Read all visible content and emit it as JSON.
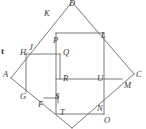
{
  "figure": {
    "type": "geometry-diagram",
    "stroke_color": "#6b6b6b",
    "label_color": "#3a3a3a",
    "background": "#ffffff",
    "width": 146,
    "height": 129
  },
  "labels": [
    {
      "id": "D",
      "text": "D",
      "x": 69,
      "y": -1
    },
    {
      "id": "K",
      "text": "K",
      "x": 44,
      "y": 9
    },
    {
      "id": "L",
      "text": "L",
      "x": 101,
      "y": 31
    },
    {
      "id": "P",
      "text": "P",
      "x": 53,
      "y": 36
    },
    {
      "id": "J",
      "text": "J",
      "x": 29,
      "y": 43
    },
    {
      "id": "H",
      "text": "H",
      "x": 20,
      "y": 48
    },
    {
      "id": "Q",
      "text": "Q",
      "x": 63,
      "y": 48
    },
    {
      "id": "t",
      "text": "t",
      "x": 1,
      "y": 47
    },
    {
      "id": "A",
      "text": "A",
      "x": 3,
      "y": 70
    },
    {
      "id": "R",
      "text": "R",
      "x": 63,
      "y": 74
    },
    {
      "id": "U",
      "text": "U",
      "x": 97,
      "y": 74
    },
    {
      "id": "C",
      "text": "C",
      "x": 136,
      "y": 70
    },
    {
      "id": "M",
      "text": "M",
      "x": 124,
      "y": 81
    },
    {
      "id": "G",
      "text": "G",
      "x": 20,
      "y": 92
    },
    {
      "id": "S",
      "text": "S",
      "x": 55,
      "y": 95
    },
    {
      "id": "F",
      "text": "F",
      "x": 38,
      "y": 101
    },
    {
      "id": "T",
      "text": "T",
      "x": 60,
      "y": 108
    },
    {
      "id": "N",
      "text": "N",
      "x": 97,
      "y": 105
    },
    {
      "id": "O",
      "text": "O",
      "x": 104,
      "y": 116
    }
  ],
  "segments": [
    {
      "name": "diamond-D-to-A",
      "x1": 72,
      "y1": 2,
      "x2": 11,
      "y2": 78
    },
    {
      "name": "diamond-D-to-C",
      "x1": 72,
      "y1": 2,
      "x2": 134,
      "y2": 74
    },
    {
      "name": "diamond-A-to-bottom",
      "x1": 11,
      "y1": 78,
      "x2": 72,
      "y2": 128
    },
    {
      "name": "diamond-C-to-bottom",
      "x1": 134,
      "y1": 74,
      "x2": 72,
      "y2": 128
    },
    {
      "name": "rect-top-P-to-L",
      "x1": 56,
      "y1": 33,
      "x2": 104,
      "y2": 33
    },
    {
      "name": "rect-left-P-to-T",
      "x1": 56,
      "y1": 33,
      "x2": 56,
      "y2": 114
    },
    {
      "name": "rect-right-L-to-O",
      "x1": 104,
      "y1": 33,
      "x2": 104,
      "y2": 114
    },
    {
      "name": "rect-bottom-T-to-O",
      "x1": 56,
      "y1": 114,
      "x2": 104,
      "y2": 114
    },
    {
      "name": "line-H-to-Q",
      "x1": 26,
      "y1": 54,
      "x2": 60,
      "y2": 54
    },
    {
      "name": "line-H-to-G",
      "x1": 26,
      "y1": 54,
      "x2": 26,
      "y2": 92
    },
    {
      "name": "line-R-to-M",
      "x1": 56,
      "y1": 79,
      "x2": 122,
      "y2": 79
    },
    {
      "name": "line-F-to-S",
      "x1": 44,
      "y1": 98,
      "x2": 58,
      "y2": 98
    },
    {
      "name": "line-S-vertical",
      "x1": 58,
      "y1": 94,
      "x2": 58,
      "y2": 102
    },
    {
      "name": "inner-left-Q-to-R",
      "x1": 60,
      "y1": 54,
      "x2": 60,
      "y2": 79
    }
  ]
}
